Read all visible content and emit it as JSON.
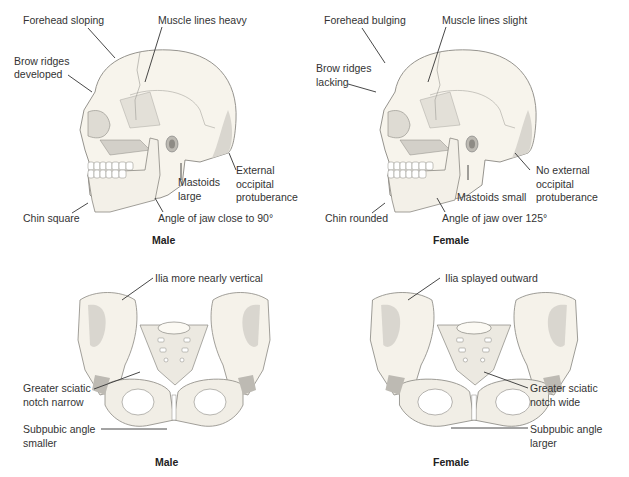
{
  "colors": {
    "bone": "#f6f3ea",
    "bone_shade": "#d9d6cf",
    "bone_dark": "#bdbab3",
    "outline": "#8a8882",
    "leader": "#333333"
  },
  "skull_male": {
    "caption": "Male",
    "labels": {
      "forehead": "Forehead sloping",
      "muscle": "Muscle lines heavy",
      "brow_1": "Brow ridges",
      "brow_2": "developed",
      "mastoid_1": "Mastoids",
      "mastoid_2": "large",
      "occipital_1": "External",
      "occipital_2": "occipital",
      "occipital_3": "protuberance",
      "chin": "Chin square",
      "jaw": "Angle of jaw close to 90°"
    }
  },
  "skull_female": {
    "caption": "Female",
    "labels": {
      "forehead": "Forehead bulging",
      "muscle": "Muscle lines slight",
      "brow_1": "Brow ridges",
      "brow_2": "lacking",
      "mastoid": "Mastoids small",
      "occipital_1": "No external",
      "occipital_2": "occipital",
      "occipital_3": "protuberance",
      "chin": "Chin rounded",
      "jaw": "Angle of jaw over 125°"
    }
  },
  "pelvis_male": {
    "caption": "Male",
    "labels": {
      "ilia": "Ilia more nearly vertical",
      "sciatic_1": "Greater sciatic",
      "sciatic_2": "notch narrow",
      "subpubic_1": "Subpubic angle",
      "subpubic_2": "smaller"
    }
  },
  "pelvis_female": {
    "caption": "Female",
    "labels": {
      "ilia": "Ilia splayed outward",
      "sciatic_1": "Greater sciatic",
      "sciatic_2": "notch wide",
      "subpubic_1": "Subpubic angle",
      "subpubic_2": "larger"
    }
  }
}
